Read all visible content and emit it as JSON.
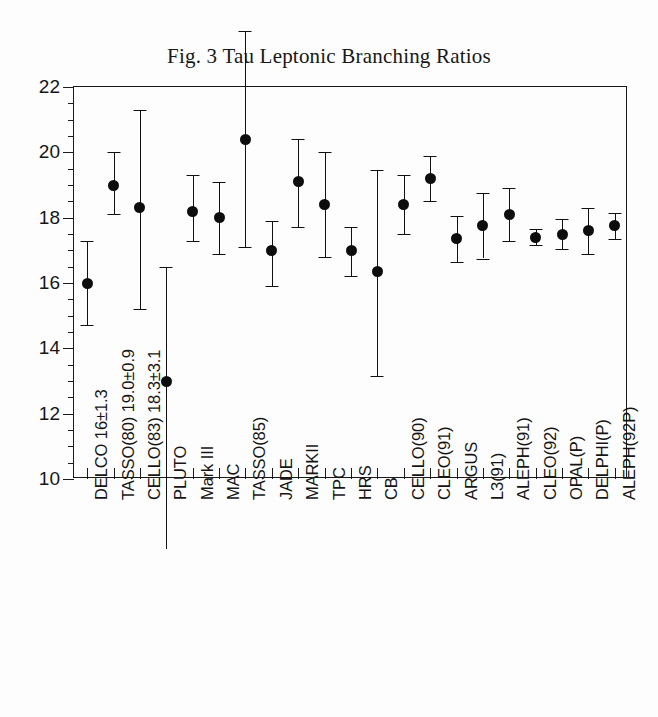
{
  "figure": {
    "title": "Fig. 3 Tau Leptonic Branching Ratios"
  },
  "chart_data": {
    "type": "scatter",
    "title": "Fig. 3 Tau Leptonic Branching Ratios",
    "xlabel": "",
    "ylabel": "",
    "ylim": [
      10,
      22
    ],
    "y_major_ticks": [
      10,
      12,
      14,
      16,
      18,
      20,
      22
    ],
    "y_minor_step": 0.5,
    "grid": false,
    "legend": "none",
    "error_bars": "vertical",
    "marker": "filled-circle",
    "categories": [
      "DELCO 16±1.3",
      "TASSO(80) 19.0±0.9",
      "CELLO(83) 18.3±3.1",
      "PLUTO",
      "Mark III",
      "MAC",
      "TASSO(85)",
      "JADE",
      "MARKII",
      "TPC",
      "HRS",
      "CB",
      "CELLO(90)",
      "CLEO(91)",
      "ARGUS",
      "L3(91)",
      "ALEPH(91)",
      "CLEO(92)",
      "OPAL(P)",
      "DELPHI(P)",
      "ALEPH(92P)"
    ],
    "values": [
      16.0,
      19.0,
      18.3,
      13.0,
      18.2,
      18.0,
      20.4,
      17.0,
      19.1,
      18.4,
      17.0,
      16.35,
      18.4,
      19.2,
      17.35,
      17.75,
      18.1,
      17.4,
      17.5,
      17.6,
      17.75
    ],
    "err_low": [
      1.3,
      0.9,
      3.1,
      3.6,
      0.9,
      1.1,
      3.3,
      1.1,
      1.4,
      1.6,
      0.8,
      3.2,
      0.9,
      0.7,
      0.7,
      1.0,
      0.8,
      0.25,
      0.45,
      0.7,
      0.4
    ],
    "err_high": [
      1.3,
      1.0,
      3.0,
      3.5,
      1.1,
      1.1,
      3.9,
      0.9,
      1.3,
      1.6,
      0.7,
      3.1,
      0.9,
      0.7,
      0.7,
      1.0,
      0.8,
      0.25,
      0.45,
      0.7,
      0.4
    ],
    "notes": {
      "pluto_lower_offscale": true,
      "tasso85_upper_offscale": true
    }
  }
}
